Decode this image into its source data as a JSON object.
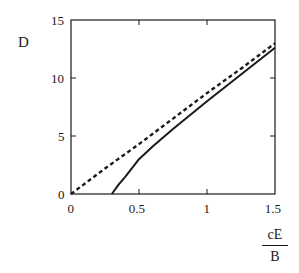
{
  "chart_data": {
    "type": "line",
    "title": "",
    "xlabel": "cE/B",
    "xlabel_numerator": "cE",
    "xlabel_denominator": "B",
    "ylabel": "D",
    "xlim": [
      0,
      1.5
    ],
    "ylim": [
      0,
      15
    ],
    "x_ticks": [
      "0",
      "0.5",
      "1",
      "1.5"
    ],
    "y_ticks": [
      "0",
      "5",
      "10",
      "15"
    ],
    "grid": false,
    "legend": null,
    "series": [
      {
        "name": "dashed",
        "style": "dashed",
        "x": [
          0,
          0.25,
          0.5,
          0.75,
          1.0,
          1.25,
          1.5
        ],
        "y": [
          0,
          2.2,
          4.3,
          6.5,
          8.7,
          10.8,
          13.0
        ]
      },
      {
        "name": "solid",
        "style": "solid",
        "x": [
          0.3,
          0.35,
          0.4,
          0.5,
          0.6,
          0.75,
          1.0,
          1.25,
          1.5
        ],
        "y": [
          0,
          0.8,
          1.5,
          3.0,
          4.1,
          5.6,
          8.0,
          10.3,
          12.6
        ]
      }
    ]
  }
}
